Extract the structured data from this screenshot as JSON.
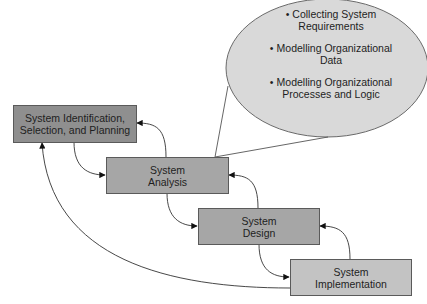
{
  "diagram": {
    "type": "sdlc-waterfall-with-feedback",
    "phases": [
      {
        "id": "identification",
        "lines": [
          "System Identification,",
          "Selection, and Planning"
        ],
        "fill": "#8f8f8f"
      },
      {
        "id": "analysis",
        "lines": [
          "System",
          "Analysis"
        ],
        "fill": "#a6a6a6"
      },
      {
        "id": "design",
        "lines": [
          "System",
          "Design"
        ],
        "fill": "#a6a6a6"
      },
      {
        "id": "implementation",
        "lines": [
          "System",
          "Implementation"
        ],
        "fill": "#c3c3c3"
      }
    ],
    "callout": {
      "attached_to": "analysis",
      "fill": "#d9d9d9",
      "bullet": "•",
      "items": [
        {
          "lines": [
            "Collecting System",
            "Requirements"
          ]
        },
        {
          "lines": [
            "Modelling Organizational",
            "Data"
          ]
        },
        {
          "lines": [
            "Modelling Organizational",
            "Processes and Logic"
          ]
        }
      ]
    },
    "edges": [
      {
        "from": "identification",
        "to": "analysis",
        "kind": "forward"
      },
      {
        "from": "analysis",
        "to": "design",
        "kind": "forward"
      },
      {
        "from": "design",
        "to": "implementation",
        "kind": "forward"
      },
      {
        "from": "analysis",
        "to": "identification",
        "kind": "feedback"
      },
      {
        "from": "design",
        "to": "analysis",
        "kind": "feedback"
      },
      {
        "from": "implementation",
        "to": "design",
        "kind": "feedback"
      },
      {
        "from": "implementation",
        "to": "identification",
        "kind": "feedback"
      }
    ]
  }
}
